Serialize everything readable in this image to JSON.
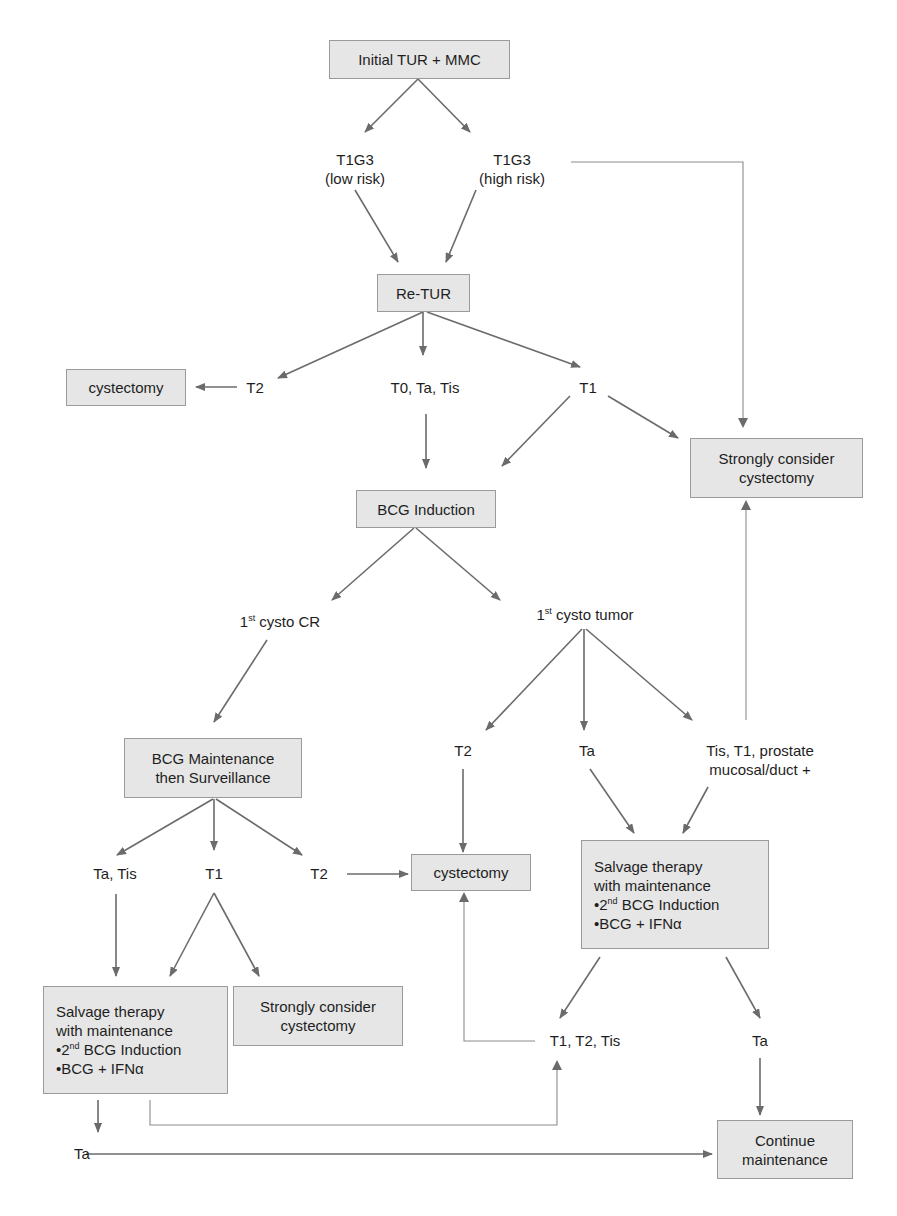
{
  "diagram": {
    "type": "flowchart",
    "description_visible": "Treatment algorithm for T1G3 bladder cancer",
    "colors": {
      "box_fill": "#e6e6e6",
      "box_border": "#9a9a9a",
      "arrow": "#6b6b6b",
      "text": "#1e1e1e"
    },
    "nodes": {
      "initial": {
        "lines": [
          "Initial TUR + MMC"
        ]
      },
      "t1g3_low": {
        "lines": [
          "T1G3",
          "(low risk)"
        ]
      },
      "t1g3_high": {
        "lines": [
          "T1G3",
          "(high risk)"
        ]
      },
      "retur": {
        "lines": [
          "Re-TUR"
        ]
      },
      "cystectomy_top": {
        "lines": [
          "cystectomy"
        ]
      },
      "retur_t2": {
        "lines": [
          "T2"
        ]
      },
      "retur_t0": {
        "lines": [
          "T0, Ta, Tis"
        ]
      },
      "retur_t1": {
        "lines": [
          "T1"
        ]
      },
      "strongly_top": {
        "lines": [
          "Strongly consider",
          "cystectomy"
        ]
      },
      "bcg_induction": {
        "lines": [
          "BCG Induction"
        ]
      },
      "cysto_cr": {
        "sup": "st",
        "pre": "1",
        "post": " cysto CR"
      },
      "cysto_tumor": {
        "sup": "st",
        "pre": "1",
        "post": " cysto tumor"
      },
      "bcg_maint": {
        "lines": [
          "BCG Maintenance",
          "then Surveillance"
        ]
      },
      "tumor_t2": {
        "lines": [
          "T2"
        ]
      },
      "tumor_ta": {
        "lines": [
          "Ta"
        ]
      },
      "tumor_tis": {
        "lines": [
          "Tis, T1, prostate",
          "mucosal/duct +"
        ]
      },
      "maint_tatis": {
        "lines": [
          "Ta, Tis"
        ]
      },
      "maint_t1": {
        "lines": [
          "T1"
        ]
      },
      "maint_t2": {
        "lines": [
          "T2"
        ]
      },
      "cystectomy_mid": {
        "lines": [
          "cystectomy"
        ]
      },
      "salvage_right": {
        "line1": "Salvage therapy",
        "line2": "with maintenance",
        "bullet1_pre": "•2",
        "bullet1_sup": "nd",
        "bullet1_post": " BCG Induction",
        "bullet2": "•BCG + IFNα"
      },
      "salvage_left": {
        "line1": "Salvage therapy",
        "line2": "with maintenance",
        "bullet1_pre": "•2",
        "bullet1_sup": "nd",
        "bullet1_post": " BCG Induction",
        "bullet2": "•BCG + IFNα"
      },
      "strongly_bottom": {
        "lines": [
          "Strongly consider",
          "cystectomy"
        ]
      },
      "salv_t1t2tis": {
        "lines": [
          "T1, T2, Tis"
        ]
      },
      "salv_ta": {
        "lines": [
          "Ta"
        ]
      },
      "left_ta": {
        "lines": [
          "Ta"
        ]
      },
      "continue": {
        "lines": [
          "Continue",
          "maintenance"
        ]
      }
    },
    "edges": [
      [
        "Initial TUR + MMC",
        "T1G3 (low risk)"
      ],
      [
        "Initial TUR + MMC",
        "T1G3 (high risk)"
      ],
      [
        "T1G3 (low risk)",
        "Re-TUR"
      ],
      [
        "T1G3 (high risk)",
        "Re-TUR"
      ],
      [
        "T1G3 (high risk)",
        "Strongly consider cystectomy (top)"
      ],
      [
        "Re-TUR",
        "T2"
      ],
      [
        "Re-TUR",
        "T0, Ta, Tis"
      ],
      [
        "Re-TUR",
        "T1"
      ],
      [
        "T2",
        "cystectomy (top)"
      ],
      [
        "T0, Ta, Tis",
        "BCG Induction"
      ],
      [
        "T1",
        "BCG Induction"
      ],
      [
        "T1",
        "Strongly consider cystectomy (top)"
      ],
      [
        "BCG Induction",
        "1st cysto CR"
      ],
      [
        "BCG Induction",
        "1st cysto tumor"
      ],
      [
        "1st cysto CR",
        "BCG Maintenance then Surveillance"
      ],
      [
        "1st cysto tumor",
        "T2"
      ],
      [
        "1st cysto tumor",
        "Ta"
      ],
      [
        "1st cysto tumor",
        "Tis, T1, prostate mucosal/duct +"
      ],
      [
        "Tis, T1, prostate mucosal/duct +",
        "Strongly consider cystectomy (top)"
      ],
      [
        "T2 (tumor)",
        "cystectomy (mid)"
      ],
      [
        "Ta (tumor)",
        "Salvage therapy (right)"
      ],
      [
        "Tis, T1, prostate mucosal/duct +",
        "Salvage therapy (right)"
      ],
      [
        "BCG Maintenance then Surveillance",
        "Ta, Tis"
      ],
      [
        "BCG Maintenance then Surveillance",
        "T1"
      ],
      [
        "BCG Maintenance then Surveillance",
        "T2"
      ],
      [
        "T2 (maint)",
        "cystectomy (mid)"
      ],
      [
        "Ta, Tis",
        "Salvage therapy (left)"
      ],
      [
        "T1 (maint)",
        "Salvage therapy (left)"
      ],
      [
        "T1 (maint)",
        "Strongly consider cystectomy (bottom)"
      ],
      [
        "Salvage therapy (right)",
        "T1, T2, Tis"
      ],
      [
        "Salvage therapy (right)",
        "Ta"
      ],
      [
        "T1, T2, Tis",
        "cystectomy (mid)"
      ],
      [
        "Ta (salvage right)",
        "Continue maintenance"
      ],
      [
        "Salvage therapy (left)",
        "Ta"
      ],
      [
        "Salvage therapy (left)",
        "T1, T2, Tis"
      ],
      [
        "Ta (salvage left)",
        "Continue maintenance"
      ]
    ]
  }
}
